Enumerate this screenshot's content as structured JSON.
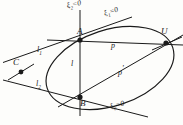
{
  "figure": {
    "type": "geometric-line-diagram",
    "background_color": "#fdfdfb",
    "ink_color": "#1a1a1a",
    "width": 183,
    "height": 125
  },
  "points": [
    {
      "id": "A",
      "label": "A",
      "x": 80,
      "y": 40,
      "label_x": 80,
      "label_y": 27
    },
    {
      "id": "B",
      "label": "B",
      "x": 80,
      "y": 97,
      "label_x": 81,
      "label_y": 101
    },
    {
      "id": "C",
      "label": "C",
      "x": 21,
      "y": 72,
      "label_x": 14,
      "label_y": 60
    },
    {
      "id": "U",
      "label": "U",
      "x": 166,
      "y": 43,
      "label_x": 163,
      "label_y": 28
    }
  ],
  "line_labels": [
    {
      "id": "l1",
      "base": "l",
      "sub": "1",
      "x": 38,
      "y": 49
    },
    {
      "id": "l2",
      "base": "l",
      "sub": "2",
      "x": 37,
      "y": 83
    },
    {
      "id": "l",
      "base": "l",
      "sub": "",
      "x": 72,
      "y": 63
    },
    {
      "id": "p",
      "base": "p",
      "sub": "",
      "x": 112,
      "y": 45
    },
    {
      "id": "pprime",
      "base": "p",
      "sub": "",
      "prime": "'",
      "x": 120,
      "y": 68
    }
  ],
  "equation_labels": [
    {
      "id": "xi2",
      "text": "ξ",
      "sub": "2",
      "rest": "=0",
      "x": 67,
      "y": 3,
      "rotate": -12
    },
    {
      "id": "xi1",
      "text": "ξ",
      "sub": "1",
      "rest": "=0",
      "x": 104,
      "y": 11,
      "rotate": -18
    },
    {
      "id": "xi0",
      "text": "ξ",
      "sub": "0",
      "rest": "=0",
      "x": 110,
      "y": 104,
      "rotate": -14
    }
  ],
  "conic": {
    "name": "ellipse",
    "center_x": 110,
    "center_y": 68,
    "radius_x": 66,
    "radius_y": 38,
    "rotation_deg": -18
  },
  "segments": [
    {
      "id": "line-l",
      "from": "A-top",
      "x1": 80,
      "y1": 10,
      "x2": 80,
      "y2": 115
    },
    {
      "id": "line-p",
      "from": "A",
      "x1": 48,
      "y1": 41,
      "x2": 182,
      "y2": 45
    },
    {
      "id": "line-p-prime",
      "from": "B",
      "x1": 60,
      "y1": 106,
      "x2": 182,
      "y2": 36
    },
    {
      "id": "line-l1",
      "from": "C",
      "x1": 4,
      "y1": 62,
      "x2": 128,
      "y2": 18
    },
    {
      "id": "line-l2",
      "from": "C",
      "x1": 4,
      "y1": 81,
      "x2": 146,
      "y2": 117
    }
  ]
}
